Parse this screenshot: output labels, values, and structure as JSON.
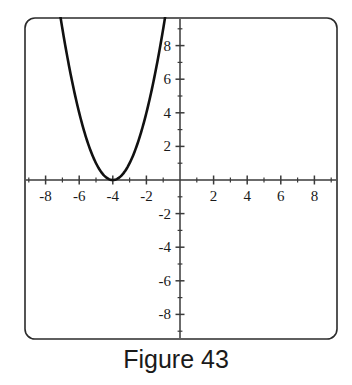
{
  "figure": {
    "caption": "Figure 43",
    "border_color": "#2b2b2b",
    "background": "#ffffff"
  },
  "chart_data": {
    "type": "line",
    "title": "Figure 43",
    "subtitle": "",
    "xlabel": "",
    "ylabel": "",
    "grid": false,
    "legend": "none",
    "curve_color": "#111111",
    "axis_color": "#3a3a3a",
    "xlim": [
      -9.3,
      9.3
    ],
    "ylim": [
      -9.6,
      9.6
    ],
    "x_tick_interval": 1,
    "x_major_interval": 2,
    "y_tick_interval": 1,
    "y_major_interval": 2,
    "x_tick_labels": [
      "-8",
      "-6",
      "-4",
      "-2",
      "2",
      "4",
      "6",
      "8"
    ],
    "x_tick_label_values": [
      -8,
      -6,
      -4,
      -2,
      2,
      4,
      6,
      8
    ],
    "y_tick_labels": [
      "8",
      "6",
      "4",
      "2",
      "-2",
      "-4",
      "-6",
      "-8"
    ],
    "y_tick_label_values": [
      8,
      6,
      4,
      2,
      -2,
      -4,
      -6,
      -8
    ],
    "equation": "y = (x + 4)^2",
    "vertex": [
      -4,
      0
    ],
    "series": [
      {
        "name": "parabola",
        "type": "parabola",
        "a": 1,
        "h": -4,
        "k": 0,
        "x": [
          -7.1,
          -6.8,
          -6.5,
          -6.2,
          -5.9,
          -5.6,
          -5.3,
          -5.0,
          -4.7,
          -4.4,
          -4.1,
          -3.8,
          -3.5,
          -3.2,
          -2.9,
          -2.6,
          -2.3,
          -2.0,
          -1.7,
          -1.4,
          -1.1,
          -0.9
        ],
        "values": [
          9.61,
          7.84,
          6.25,
          4.84,
          3.61,
          2.56,
          1.69,
          1.0,
          0.49,
          0.16,
          0.01,
          0.04,
          0.25,
          0.64,
          1.21,
          1.96,
          2.89,
          4.0,
          5.29,
          6.76,
          8.41,
          9.61
        ]
      }
    ]
  }
}
